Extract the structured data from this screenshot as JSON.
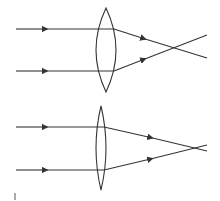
{
  "diagram": {
    "stroke_color": "#333333",
    "panels": [
      {
        "name": "thick-lens",
        "lens": {
          "cx": 106,
          "top": 8,
          "bottom": 92,
          "half_width": 10
        },
        "rays": [
          {
            "y_in": 29,
            "lens_x": 114,
            "y_lens": 29,
            "focus": [
              173,
              48
            ],
            "end": [
              207,
              58
            ]
          },
          {
            "y_in": 71,
            "lens_x": 114,
            "y_lens": 71,
            "focus": [
              173,
              48
            ],
            "end": [
              207,
              35
            ]
          }
        ]
      },
      {
        "name": "thin-lens",
        "lens": {
          "cx": 101,
          "top": 106,
          "bottom": 190,
          "half_width": 5
        },
        "rays": [
          {
            "y_in": 127,
            "lens_x": 104,
            "y_lens": 127,
            "focus": [
              197,
              148
            ],
            "end": [
              207,
              151
            ]
          },
          {
            "y_in": 170,
            "lens_x": 104,
            "y_lens": 170,
            "focus": [
              197,
              148
            ],
            "end": [
              207,
              145
            ]
          }
        ]
      }
    ]
  }
}
